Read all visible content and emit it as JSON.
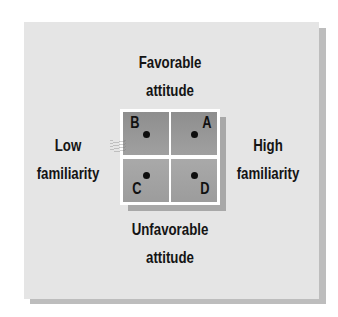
{
  "diagram": {
    "labels": {
      "top": [
        "Favorable",
        "attitude"
      ],
      "bottom": [
        "Unfavorable",
        "attitude"
      ],
      "left": [
        "Low",
        "familiarity"
      ],
      "right": [
        "High",
        "familiarity"
      ]
    },
    "quadrants": [
      {
        "id": "B",
        "position": "top-left",
        "label": "B"
      },
      {
        "id": "A",
        "position": "top-right",
        "label": "A"
      },
      {
        "id": "C",
        "position": "bottom-left",
        "label": "C"
      },
      {
        "id": "D",
        "position": "bottom-right",
        "label": "D"
      }
    ],
    "colors": {
      "card_background": "#e5e5e5",
      "card_shadow": "#bdbdbd",
      "quadrant_fill": "#999999",
      "grid_lines": "#ffffff",
      "text": "#141414"
    }
  }
}
